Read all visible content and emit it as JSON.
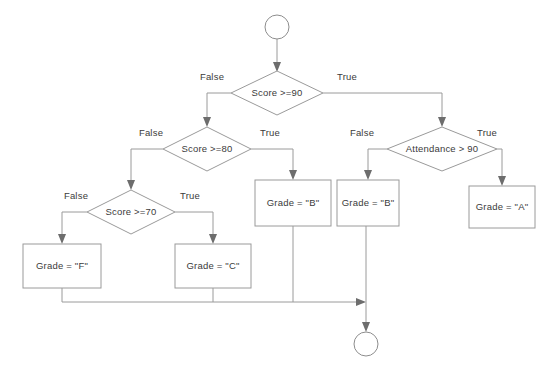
{
  "diagram": {
    "background_color": "#ffffff",
    "stroke_color": "#9a9a9a",
    "text_color": "#3b3b3b",
    "arrow_color": "#6d6d6d"
  },
  "nodes": [
    {
      "id": "start",
      "type": "terminator",
      "shape": "circle",
      "label": "",
      "cx": 277,
      "cy": 27,
      "r": 12
    },
    {
      "id": "d_score90",
      "type": "decision",
      "shape": "diamond",
      "label": "Score >=90",
      "cx": 277,
      "cy": 93,
      "w": 92,
      "h": 44
    },
    {
      "id": "d_score80",
      "type": "decision",
      "shape": "diamond",
      "label": "Score >=80",
      "cx": 207,
      "cy": 149,
      "w": 88,
      "h": 44
    },
    {
      "id": "d_score70",
      "type": "decision",
      "shape": "diamond",
      "label": "Score >=70",
      "cx": 131,
      "cy": 212,
      "w": 88,
      "h": 44
    },
    {
      "id": "d_attendance",
      "type": "decision",
      "shape": "diamond",
      "label": "Attendance > 90",
      "cx": 442,
      "cy": 149,
      "w": 110,
      "h": 44
    },
    {
      "id": "p_grade_b1",
      "type": "process",
      "shape": "rect",
      "label": "Grade = \"B\"",
      "cx": 293,
      "cy": 203,
      "w": 76,
      "h": 45
    },
    {
      "id": "p_grade_b2",
      "type": "process",
      "shape": "rect",
      "label": "Grade = \"B\"",
      "cx": 368,
      "cy": 203,
      "w": 62,
      "h": 45
    },
    {
      "id": "p_grade_a",
      "type": "process",
      "shape": "rect",
      "label": "Grade = \"A\"",
      "cx": 502,
      "cy": 207,
      "w": 66,
      "h": 42
    },
    {
      "id": "p_grade_f",
      "type": "process",
      "shape": "rect",
      "label": "Grade = \"F\"",
      "cx": 62,
      "cy": 266,
      "w": 78,
      "h": 44
    },
    {
      "id": "p_grade_c",
      "type": "process",
      "shape": "rect",
      "label": "Grade = \"C\"",
      "cx": 213,
      "cy": 266,
      "w": 76,
      "h": 44
    },
    {
      "id": "end",
      "type": "terminator",
      "shape": "circle",
      "label": "",
      "cx": 366,
      "cy": 344,
      "r": 12
    }
  ],
  "edges": [
    {
      "id": "e_start_d90",
      "from": "start",
      "to": "d_score90",
      "label": ""
    },
    {
      "id": "e_d90_false",
      "from": "d_score90",
      "to": "d_score80",
      "label": "False",
      "label_x": 212,
      "label_y": 77
    },
    {
      "id": "e_d90_true",
      "from": "d_score90",
      "to": "d_attendance",
      "label": "True",
      "label_x": 347,
      "label_y": 77
    },
    {
      "id": "e_d80_false",
      "from": "d_score80",
      "to": "d_score70",
      "label": "False",
      "label_x": 151,
      "label_y": 133
    },
    {
      "id": "e_d80_true",
      "from": "d_score80",
      "to": "p_grade_b1",
      "label": "True",
      "label_x": 270,
      "label_y": 133
    },
    {
      "id": "e_d70_false",
      "from": "d_score70",
      "to": "p_grade_f",
      "label": "False",
      "label_x": 76,
      "label_y": 196
    },
    {
      "id": "e_d70_true",
      "from": "d_score70",
      "to": "p_grade_c",
      "label": "True",
      "label_x": 190,
      "label_y": 196
    },
    {
      "id": "e_att_false",
      "from": "d_attendance",
      "to": "p_grade_b2",
      "label": "False",
      "label_x": 362,
      "label_y": 133
    },
    {
      "id": "e_att_true",
      "from": "d_attendance",
      "to": "p_grade_a",
      "label": "True",
      "label_x": 487,
      "label_y": 133
    },
    {
      "id": "e_f_merge",
      "from": "p_grade_f",
      "to": "end",
      "label": ""
    },
    {
      "id": "e_c_merge",
      "from": "p_grade_c",
      "to": "end",
      "label": ""
    },
    {
      "id": "e_b1_merge",
      "from": "p_grade_b1",
      "to": "end",
      "label": ""
    },
    {
      "id": "e_b2_end",
      "from": "p_grade_b2",
      "to": "end",
      "label": ""
    }
  ]
}
